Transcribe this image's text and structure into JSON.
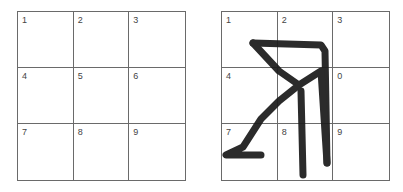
{
  "left_grid": {
    "cells": [
      "1",
      "2",
      "3",
      "4",
      "5",
      "6",
      "7",
      "8",
      "9"
    ]
  },
  "right_grid": {
    "cells": [
      "1",
      "2",
      "3",
      "4",
      "",
      "0",
      "7",
      "8",
      "9"
    ],
    "stroke_color": "#1a1a1a"
  }
}
